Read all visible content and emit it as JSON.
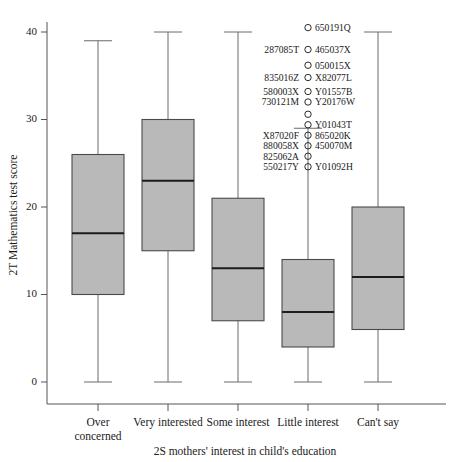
{
  "chart_data": {
    "type": "box",
    "title": "",
    "xlabel": "2S mothers' interest in child's education",
    "ylabel": "2T Mathematics test score",
    "ylim": [
      0,
      41
    ],
    "yticks": [
      0,
      10,
      20,
      30,
      40
    ],
    "ytick_labels": [
      "0",
      "10",
      "20",
      "30",
      "40"
    ],
    "grid": false,
    "legend": "none",
    "categories": [
      "Over concerned",
      "Very interested",
      "Some interest",
      "Little interest",
      "Can't say"
    ],
    "category_lines": [
      [
        "Over",
        "concerned"
      ],
      [
        "Very interested"
      ],
      [
        "Some interest"
      ],
      [
        "Little interest"
      ],
      [
        "Can't say"
      ]
    ],
    "boxes": [
      {
        "category": "Over concerned",
        "whisker_low": 0,
        "q1": 10,
        "median": 17,
        "q3": 26,
        "whisker_high": 39,
        "outliers": []
      },
      {
        "category": "Very interested",
        "whisker_low": 0,
        "q1": 15,
        "median": 23,
        "q3": 30,
        "whisker_high": 40,
        "outliers": []
      },
      {
        "category": "Some interest",
        "whisker_low": 0,
        "q1": 7,
        "median": 13,
        "q3": 21,
        "whisker_high": 40,
        "outliers": []
      },
      {
        "category": "Little interest",
        "whisker_low": 0,
        "q1": 4,
        "median": 8,
        "q3": 14,
        "whisker_high": 29,
        "outliers": [
          40.5,
          38.0,
          36.2,
          34.8,
          33.2,
          32.0,
          30.6,
          29.4,
          28.2,
          27.0,
          25.8,
          24.6
        ]
      },
      {
        "category": "Can't say",
        "whisker_low": 0,
        "q1": 6,
        "median": 12,
        "q3": 20,
        "whisker_high": 40,
        "outliers": []
      }
    ],
    "outlier_annotations": [
      {
        "value": 40.5,
        "right": "650191Q",
        "left": ""
      },
      {
        "value": 38.0,
        "right": "465037X",
        "left": "287085T"
      },
      {
        "value": 36.2,
        "right": "050015X",
        "left": ""
      },
      {
        "value": 34.8,
        "right": "X82077L",
        "left": "835016Z"
      },
      {
        "value": 33.2,
        "right": "Y01557B",
        "left": "580003X"
      },
      {
        "value": 32.0,
        "right": "Y20176W",
        "left": "730121M"
      },
      {
        "value": 30.6,
        "right": "",
        "left": ""
      },
      {
        "value": 29.4,
        "right": "Y01043T",
        "left": ""
      },
      {
        "value": 28.2,
        "right": "865020K",
        "left": "X87020F"
      },
      {
        "value": 27.0,
        "right": "450070M",
        "left": "880058X"
      },
      {
        "value": 25.8,
        "right": "",
        "left": "825062A"
      },
      {
        "value": 24.6,
        "right": "Y01092H",
        "left": "550217Y"
      }
    ],
    "colors": {
      "box_fill": "#b9b9b9",
      "box_stroke": "#4a4a4a",
      "median_stroke": "#1c1c1c",
      "whisker_stroke": "#6a6a6a",
      "axis_stroke": "#555555",
      "text": "#1a1a1a",
      "background": "#ffffff"
    }
  }
}
